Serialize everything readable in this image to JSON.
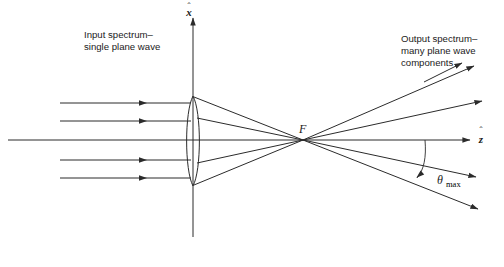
{
  "figure": {
    "type": "optics-ray-diagram",
    "background_color": "#ffffff",
    "ink_color": "#2b2b2b",
    "width": 504,
    "height": 267
  },
  "labels": {
    "input_line1": "Input spectrum–",
    "input_line2": "single plane wave",
    "output_line1": "Output spectrum–",
    "output_line2": "many plane wave",
    "output_line3": "components",
    "focal_point": "F",
    "angle_symbol": "θ",
    "angle_subscript": "max",
    "x_axis": "x",
    "z_axis": "z",
    "x_axis_hat": "ˆ",
    "z_axis_hat": "ˆ"
  },
  "geometry": {
    "optical_axis": {
      "x1": 8,
      "y1": 140,
      "x2": 470,
      "y2": 140
    },
    "vertical_axis": {
      "x1": 193,
      "y1": 237,
      "x2": 193,
      "y2": 16
    },
    "lens": {
      "cx": 193,
      "cy": 141,
      "top_y": 96,
      "bottom_y": 186,
      "half_width": 8
    },
    "focal_point": {
      "x": 303,
      "y": 140
    },
    "input_rays": [
      {
        "y": 103,
        "x_start": 60,
        "x_end": 190,
        "arrow_at": 143
      },
      {
        "y": 121,
        "x_start": 60,
        "x_end": 190,
        "arrow_at": 143
      },
      {
        "y": 160,
        "x_start": 60,
        "x_end": 190,
        "arrow_at": 143
      },
      {
        "y": 178,
        "x_start": 60,
        "x_end": 190,
        "arrow_at": 143
      }
    ],
    "converging_rays": [
      {
        "x1": 193,
        "y1": 97,
        "x2": 303,
        "y2": 140
      },
      {
        "x1": 193,
        "y1": 118,
        "x2": 303,
        "y2": 140
      },
      {
        "x1": 193,
        "y1": 163,
        "x2": 303,
        "y2": 140
      },
      {
        "x1": 193,
        "y1": 185,
        "x2": 303,
        "y2": 140
      }
    ],
    "output_rays": [
      {
        "x2": 478,
        "y2": 64,
        "angle_deg": -22.0
      },
      {
        "x2": 486,
        "y2": 100,
        "angle_deg": -12.6
      },
      {
        "x2": 480,
        "y2": 178,
        "angle_deg": 12.3
      },
      {
        "x2": 482,
        "y2": 210,
        "angle_deg": 21.5
      }
    ],
    "angle_arc": {
      "start_x": 425,
      "start_y": 140,
      "end_x": 418,
      "end_y": 177
    },
    "output_label_leader": {
      "x1": 428,
      "y1": 80,
      "x2": 465,
      "y2": 62
    }
  }
}
